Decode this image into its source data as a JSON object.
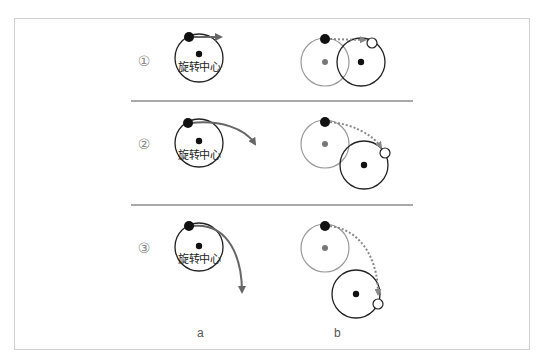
{
  "diagram": {
    "steps": [
      {
        "label": "①",
        "center_text": "旋转中心",
        "motion": "tangent-straight"
      },
      {
        "label": "②",
        "center_text": "旋转中心",
        "motion": "curved-slight"
      },
      {
        "label": "③",
        "center_text": "旋转中心",
        "motion": "curved-strong"
      }
    ],
    "columns": [
      {
        "label": "a"
      },
      {
        "label": "b"
      }
    ],
    "colors": {
      "border": "#d0d0d0",
      "separator": "#555555",
      "circle_dark": "#222222",
      "circle_light": "#9a9a9a",
      "arrow": "#666666",
      "dotted_arrow": "#888888",
      "dot_black": "#111111",
      "dot_grey": "#777777",
      "step_label": "#8a8a8a"
    }
  }
}
